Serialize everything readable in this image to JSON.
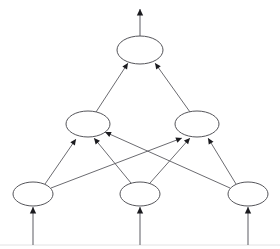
{
  "diagram": {
    "type": "neural-network-graph",
    "background_color": "#ffffff",
    "node_stroke_color": "#55555a",
    "node_fill_color": "#ffffff",
    "edge_color": "#5a5a60",
    "arrow_color": "#1b1b1f",
    "baseline_color": "#e2e2e4",
    "canvas": {
      "width": 280,
      "height": 249
    },
    "layers": [
      {
        "id": "output-layer",
        "name": "output-layer",
        "role": "output",
        "node_count": 1,
        "nodes": [
          {
            "id": "out-1",
            "name": "output-node-1",
            "label": "",
            "cx": 140,
            "cy": 50,
            "rx": 23,
            "ry": 14
          }
        ]
      },
      {
        "id": "hidden-layer",
        "name": "hidden-layer",
        "role": "hidden",
        "node_count": 2,
        "nodes": [
          {
            "id": "hid-1",
            "name": "hidden-node-1",
            "label": "",
            "cx": 88,
            "cy": 124,
            "rx": 22,
            "ry": 13
          },
          {
            "id": "hid-2",
            "name": "hidden-node-2",
            "label": "",
            "cx": 197,
            "cy": 124,
            "rx": 22,
            "ry": 13
          }
        ]
      },
      {
        "id": "input-layer",
        "name": "input-layer",
        "role": "input",
        "node_count": 3,
        "nodes": [
          {
            "id": "in-1",
            "name": "input-node-1",
            "label": "",
            "cx": 33,
            "cy": 194,
            "rx": 20,
            "ry": 12
          },
          {
            "id": "in-2",
            "name": "input-node-2",
            "label": "",
            "cx": 140,
            "cy": 194,
            "rx": 20,
            "ry": 12
          },
          {
            "id": "in-3",
            "name": "input-node-3",
            "label": "",
            "cx": 248,
            "cy": 194,
            "rx": 20,
            "ry": 12
          }
        ]
      }
    ],
    "edges": [
      {
        "id": "e-in1-hid1",
        "name": "edge-input-1-to-hidden-1",
        "from": "in-1",
        "to": "hid-1",
        "x1": 45,
        "y1": 184,
        "x2": 76,
        "y2": 139,
        "directed": true
      },
      {
        "id": "e-in1-hid2",
        "name": "edge-input-1-to-hidden-2",
        "from": "in-1",
        "to": "hid-2",
        "x1": 51,
        "y1": 188,
        "x2": 182,
        "y2": 138,
        "directed": true
      },
      {
        "id": "e-in2-hid1",
        "name": "edge-input-2-to-hidden-1",
        "from": "in-2",
        "to": "hid-1",
        "x1": 131,
        "y1": 183,
        "x2": 94,
        "y2": 138,
        "directed": true
      },
      {
        "id": "e-in2-hid2",
        "name": "edge-input-2-to-hidden-2",
        "from": "in-2",
        "to": "hid-2",
        "x1": 150,
        "y1": 183,
        "x2": 190,
        "y2": 138,
        "directed": true
      },
      {
        "id": "e-in3-hid1",
        "name": "edge-input-3-to-hidden-1",
        "from": "in-3",
        "to": "hid-1",
        "x1": 230,
        "y1": 188,
        "x2": 105,
        "y2": 132,
        "directed": true
      },
      {
        "id": "e-in3-hid2",
        "name": "edge-input-3-to-hidden-2",
        "from": "in-3",
        "to": "hid-2",
        "x1": 236,
        "y1": 184,
        "x2": 208,
        "y2": 138,
        "directed": true
      },
      {
        "id": "e-hid1-out1",
        "name": "edge-hidden-1-to-output-1",
        "from": "hid-1",
        "to": "out-1",
        "x1": 96,
        "y1": 112,
        "x2": 128,
        "y2": 63,
        "directed": true
      },
      {
        "id": "e-hid2-out1",
        "name": "edge-hidden-2-to-output-1",
        "from": "hid-2",
        "to": "out-1",
        "x1": 190,
        "y1": 112,
        "x2": 155,
        "y2": 63,
        "directed": true
      }
    ],
    "io_arrows": [
      {
        "id": "io-out",
        "name": "network-output-arrow",
        "direction": "up",
        "x1": 140,
        "y1": 37,
        "x2": 140,
        "y2": 9
      },
      {
        "id": "io-in-1",
        "name": "network-input-arrow-1",
        "direction": "up",
        "x1": 33,
        "y1": 245,
        "x2": 33,
        "y2": 207
      },
      {
        "id": "io-in-2",
        "name": "network-input-arrow-2",
        "direction": "up",
        "x1": 140,
        "y1": 245,
        "x2": 140,
        "y2": 207
      },
      {
        "id": "io-in-3",
        "name": "network-input-arrow-3",
        "direction": "up",
        "x1": 248,
        "y1": 245,
        "x2": 248,
        "y2": 207
      }
    ],
    "baseline": {
      "name": "bottom-rule",
      "x1": 0,
      "y1": 245,
      "x2": 280,
      "y2": 245
    }
  }
}
